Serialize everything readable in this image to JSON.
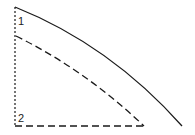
{
  "diagram": {
    "labels": {
      "curve1": "1",
      "curve2": "2"
    },
    "colors": {
      "stroke": "#1a1a1a",
      "background": "#ffffff"
    }
  }
}
